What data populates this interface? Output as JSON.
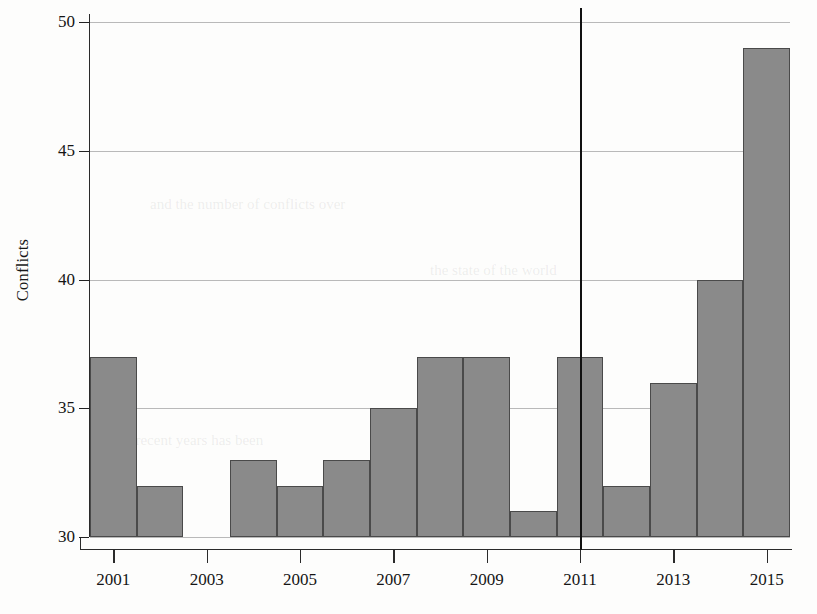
{
  "chart_data": {
    "type": "bar",
    "title": "",
    "subtitle": "",
    "xlabel": "",
    "ylabel": "Conflicts",
    "categories": [
      2001,
      2002,
      2003,
      2004,
      2005,
      2006,
      2007,
      2008,
      2009,
      2010,
      2011,
      2012,
      2013,
      2014,
      2015
    ],
    "values": [
      37,
      32,
      null,
      33,
      32,
      33,
      35,
      37,
      37,
      31,
      37,
      32,
      36,
      40,
      49
    ],
    "series": [
      {
        "name": "Conflicts",
        "values": [
          37,
          32,
          null,
          33,
          32,
          33,
          35,
          37,
          37,
          31,
          37,
          32,
          36,
          40,
          49
        ]
      }
    ],
    "xlim": [
      2000.5,
      2015.5
    ],
    "ylim": [
      30,
      50
    ],
    "yticks": [
      30,
      35,
      40,
      45,
      50
    ],
    "ytick_labels": [
      "30",
      "35",
      "40",
      "45",
      "50"
    ],
    "xticks": [
      2001,
      2003,
      2005,
      2007,
      2009,
      2011,
      2013,
      2015
    ],
    "xtick_labels": [
      "2001",
      "2003",
      "2005",
      "2007",
      "2009",
      "2011",
      "2013",
      "2015"
    ],
    "grid": "horizontal",
    "legend": null,
    "annotations": [
      {
        "type": "vertical-line",
        "x": 2011,
        "label": "",
        "note": "vertical reference line at 2011 spanning full plot height"
      }
    ],
    "bar_fill_color": "#8a8a8a",
    "bar_edge_color": "#4a4a4a",
    "axis_color": "#2a2a2a",
    "gridline_color": "#b9b9b9",
    "background_color": "#fdfdfc"
  },
  "page": {
    "bleed_text": [
      "and the number of conflicts over",
      "in recent years has been",
      "the state of the world"
    ]
  }
}
